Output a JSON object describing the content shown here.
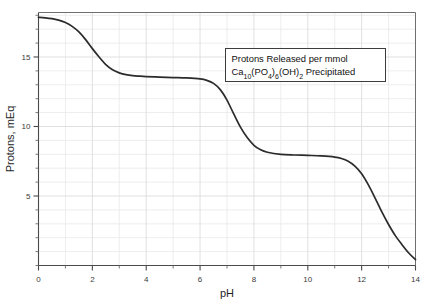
{
  "chart_data": {
    "type": "line",
    "title": "",
    "xlabel": "pH",
    "ylabel": "Protons, mEq",
    "xlim": [
      0,
      14
    ],
    "ylim": [
      0,
      18.2
    ],
    "grid": true,
    "legend_position": "none",
    "xticks": [
      0,
      2,
      4,
      6,
      8,
      10,
      12,
      14
    ],
    "xtick_labels": [
      "0",
      "2",
      "4",
      "6",
      "8",
      "10",
      "12",
      "14"
    ],
    "x_minor_step": 1,
    "yticks": [
      5,
      10,
      15
    ],
    "ytick_labels": [
      "5",
      "10",
      "15"
    ],
    "y_minor_step": 1,
    "annotation": {
      "line1": "Protons Released per mmol",
      "line2_parts": [
        {
          "text": "Ca",
          "sub": false
        },
        {
          "text": "10",
          "sub": true
        },
        {
          "text": "(PO",
          "sub": false
        },
        {
          "text": "4",
          "sub": true
        },
        {
          "text": ")",
          "sub": false
        },
        {
          "text": "6",
          "sub": true
        },
        {
          "text": "(OH)",
          "sub": false
        },
        {
          "text": "2",
          "sub": true
        },
        {
          "text": " Precipitated",
          "sub": false
        }
      ],
      "line2_plain": "Ca10(PO4)6(OH)2 Precipitated"
    },
    "series": [
      {
        "name": "protons released",
        "x": [
          0.0,
          0.25,
          0.5,
          0.75,
          1.0,
          1.25,
          1.5,
          1.75,
          2.0,
          2.25,
          2.5,
          2.75,
          3.0,
          3.25,
          3.5,
          3.75,
          4.0,
          4.5,
          5.0,
          5.5,
          6.0,
          6.25,
          6.5,
          6.75,
          7.0,
          7.25,
          7.5,
          7.75,
          8.0,
          8.25,
          8.5,
          9.0,
          9.5,
          10.0,
          10.5,
          11.0,
          11.25,
          11.5,
          11.75,
          12.0,
          12.25,
          12.5,
          12.75,
          13.0,
          13.25,
          13.5,
          13.75,
          14.0
        ],
        "y": [
          17.85,
          17.82,
          17.76,
          17.65,
          17.48,
          17.2,
          16.8,
          16.25,
          15.6,
          15.0,
          14.45,
          14.08,
          13.86,
          13.73,
          13.66,
          13.62,
          13.59,
          13.55,
          13.52,
          13.49,
          13.42,
          13.32,
          13.1,
          12.65,
          11.9,
          10.9,
          9.95,
          9.2,
          8.65,
          8.32,
          8.15,
          8.0,
          7.95,
          7.92,
          7.88,
          7.8,
          7.7,
          7.5,
          7.15,
          6.6,
          5.8,
          4.85,
          3.85,
          2.95,
          2.15,
          1.5,
          0.9,
          0.42
        ]
      }
    ],
    "plateaus": [
      {
        "label": "initial",
        "value": 17.85,
        "ph_range": [
          0,
          0.6
        ]
      },
      {
        "label": "first",
        "value": 13.55,
        "ph_range": [
          3.6,
          6.0
        ]
      },
      {
        "label": "second",
        "value": 7.9,
        "ph_range": [
          8.8,
          10.8
        ]
      },
      {
        "label": "final",
        "value": 0.42,
        "ph_range": [
          14,
          14
        ]
      }
    ],
    "transitions": [
      {
        "midpoint_ph": 2.3
      },
      {
        "midpoint_ph": 7.3
      },
      {
        "midpoint_ph": 12.5
      }
    ],
    "colors": {
      "curve": "#2b2b2b",
      "axis": "#4a4a4a",
      "grid_minor": "#e8e8e8",
      "grid_major": "#dcdcdc",
      "background": "#ffffff",
      "annotation_border": "#3c3c3c"
    }
  }
}
